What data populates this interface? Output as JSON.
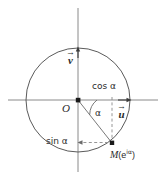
{
  "figure": {
    "type": "geometry-diagram",
    "title_visible": false,
    "colors": {
      "stroke": "#4a4a4a",
      "axis": "#7a7a7a",
      "text": "#2b2b2b",
      "background": "#ffffff"
    }
  },
  "labels": {
    "origin": "O",
    "angle": "α",
    "cos": "cos α",
    "sin": "sin α",
    "point_m": "M",
    "point_m_value": "(e",
    "point_m_exp": "iα",
    "point_m_close": ")",
    "vector_u": "u",
    "vector_v": "v",
    "arrow_glyph": "→"
  },
  "geometry": {
    "center_x": 78,
    "center_y": 100,
    "radius": 52,
    "point_m_x": 112,
    "point_m_y": 143,
    "angle_degrees": -52,
    "vector_u_tip_x": 130,
    "vector_u_tip_y": 100,
    "vector_v_tip_x": 78,
    "vector_v_tip_y": 48,
    "x_axis_from": 8,
    "x_axis_to": 158,
    "y_axis_from": 8,
    "y_axis_to": 172
  }
}
